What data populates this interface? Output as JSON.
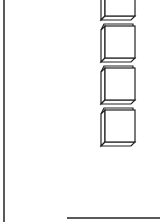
{
  "diagram": {
    "background": "#ffffff",
    "stroke_color": "#222222",
    "left_border": {
      "x": 4,
      "y1": 0,
      "y2": 222
    },
    "bottom_line": {
      "x1": 67,
      "x2": 160,
      "y": 218
    },
    "cubes": [
      {
        "id": "cube-1",
        "x": 105,
        "y": -14,
        "w": 30,
        "h": 30,
        "depth": 4
      },
      {
        "id": "cube-2",
        "x": 105,
        "y": 26,
        "w": 30,
        "h": 32,
        "depth": 4
      },
      {
        "id": "cube-3",
        "x": 105,
        "y": 68,
        "w": 30,
        "h": 32,
        "depth": 4
      },
      {
        "id": "cube-4",
        "x": 105,
        "y": 110,
        "w": 30,
        "h": 32,
        "depth": 4
      }
    ]
  }
}
